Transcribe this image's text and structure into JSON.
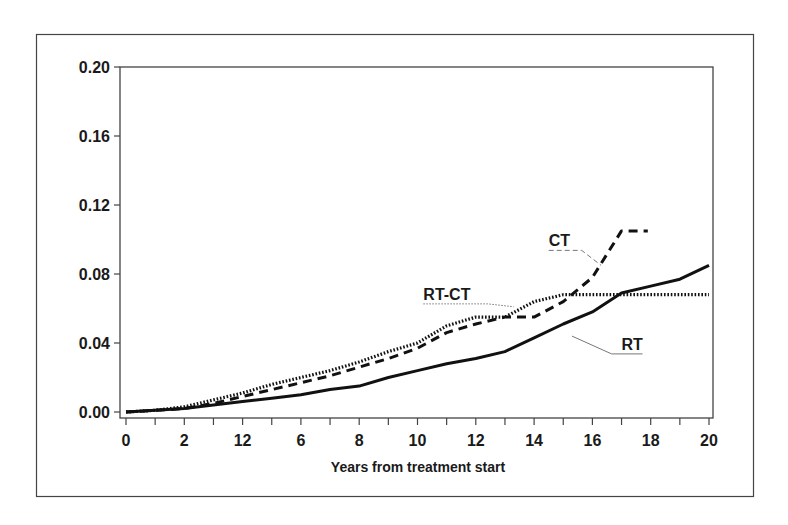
{
  "chart_data": {
    "type": "line",
    "title": "",
    "xlabel": "Years from treatment start",
    "ylabel": "",
    "xlim": [
      0,
      20
    ],
    "ylim": [
      0,
      0.2
    ],
    "grid": false,
    "legend_position": "inline labels",
    "x_ticks": [
      0,
      1,
      2,
      3,
      4,
      5,
      6,
      7,
      8,
      9,
      10,
      11,
      12,
      13,
      14,
      15,
      16,
      17,
      18,
      19,
      20
    ],
    "x_tick_labels": [
      {
        "x": 0,
        "label": "0"
      },
      {
        "x": 2,
        "label": "2"
      },
      {
        "x": 4,
        "label": "12"
      },
      {
        "x": 6,
        "label": "6"
      },
      {
        "x": 8,
        "label": "8"
      },
      {
        "x": 10,
        "label": "10"
      },
      {
        "x": 12,
        "label": "12"
      },
      {
        "x": 14,
        "label": "14"
      },
      {
        "x": 16,
        "label": "16"
      },
      {
        "x": 18,
        "label": "18"
      },
      {
        "x": 20,
        "label": "20"
      }
    ],
    "y_ticks": [
      {
        "y": 0.0,
        "label": "0.00"
      },
      {
        "y": 0.04,
        "label": "0.04"
      },
      {
        "y": 0.08,
        "label": "0.08"
      },
      {
        "y": 0.12,
        "label": "0.12"
      },
      {
        "y": 0.16,
        "label": "0.16"
      },
      {
        "y": 0.2,
        "label": "0.20"
      }
    ],
    "series": [
      {
        "name": "RT",
        "style": "solid",
        "x": [
          0,
          1,
          2,
          3,
          4,
          5,
          6,
          7,
          8,
          9,
          10,
          11,
          12,
          13,
          14,
          15,
          16,
          17,
          18,
          19,
          20
        ],
        "values": [
          0.0,
          0.001,
          0.002,
          0.004,
          0.006,
          0.008,
          0.01,
          0.013,
          0.015,
          0.02,
          0.024,
          0.028,
          0.031,
          0.035,
          0.043,
          0.051,
          0.058,
          0.069,
          0.073,
          0.077,
          0.085
        ],
        "label": {
          "text": "RT",
          "x": 17.0,
          "y": 0.036,
          "leader_to": {
            "x": 15.3,
            "y": 0.044
          }
        }
      },
      {
        "name": "CT",
        "style": "dashed",
        "x": [
          0,
          1,
          2,
          3,
          4,
          5,
          6,
          7,
          8,
          9,
          10,
          11,
          12,
          13,
          14,
          15,
          16,
          17,
          17.9
        ],
        "values": [
          0.0,
          0.001,
          0.002,
          0.005,
          0.009,
          0.013,
          0.017,
          0.021,
          0.026,
          0.031,
          0.037,
          0.046,
          0.051,
          0.055,
          0.055,
          0.064,
          0.078,
          0.105,
          0.105
        ],
        "label": {
          "text": "CT",
          "x": 14.5,
          "y": 0.096,
          "leader_to": {
            "x": 16.3,
            "y": 0.085
          }
        }
      },
      {
        "name": "RT-CT",
        "style": "dotted",
        "x": [
          0,
          1,
          2,
          3,
          4,
          5,
          6,
          7,
          8,
          9,
          10,
          11,
          12,
          13,
          14,
          15,
          16,
          17,
          18,
          19,
          20
        ],
        "values": [
          0.0,
          0.001,
          0.003,
          0.007,
          0.011,
          0.016,
          0.02,
          0.024,
          0.029,
          0.035,
          0.04,
          0.05,
          0.055,
          0.055,
          0.064,
          0.068,
          0.068,
          0.068,
          0.068,
          0.068,
          0.068
        ],
        "label": {
          "text": "RT-CT",
          "x": 10.2,
          "y": 0.065,
          "leader_to": {
            "x": 13.3,
            "y": 0.061
          }
        }
      }
    ],
    "colors": {
      "line": "#111111",
      "frame": "#444444",
      "leader": "#777777",
      "background": "#ffffff"
    }
  }
}
